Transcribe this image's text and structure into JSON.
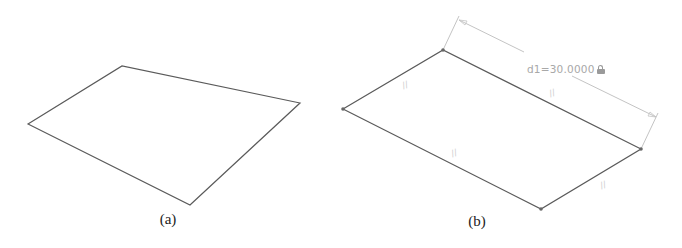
{
  "figure_a": {
    "caption": "(a)",
    "shape": "quadrilateral",
    "vertices": [
      [
        28,
        124
      ],
      [
        122,
        66
      ],
      [
        300,
        103
      ],
      [
        190,
        205
      ]
    ],
    "stroke_color": "#555555"
  },
  "figure_b": {
    "caption": "(b)",
    "shape": "parallelogram",
    "vertices": [
      [
        343,
        109
      ],
      [
        443,
        50
      ],
      [
        641,
        149
      ],
      [
        541,
        209
      ]
    ],
    "stroke_color": "#555555",
    "vertex_dot_color": "#666666",
    "dimension": {
      "label": "d1=30.0000",
      "icon": "lock-icon",
      "line_start": [
        459,
        19
      ],
      "line_end": [
        657,
        117
      ],
      "color": "#bdbdbd"
    },
    "constraint_glyphs": [
      {
        "symbol": "//",
        "pos": [
          405,
          85
        ]
      },
      {
        "symbol": "//",
        "pos": [
          552,
          93
        ]
      },
      {
        "symbol": "//",
        "pos": [
          454,
          153
        ]
      },
      {
        "symbol": "//",
        "pos": [
          603,
          185
        ]
      }
    ]
  }
}
